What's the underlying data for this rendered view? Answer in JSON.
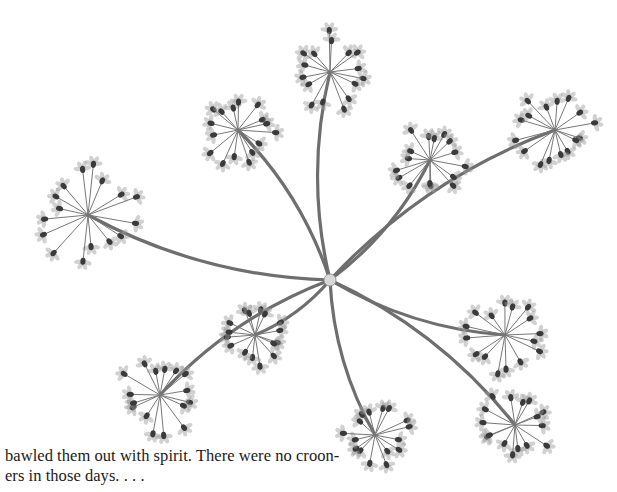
{
  "page": {
    "illustration": {
      "subject": "umbel-flower-plant",
      "stem_color": "#6e6e6e",
      "floret_color": "#9a9a9a",
      "bud_color": "#3a3a3a",
      "hub": {
        "x": 330,
        "y": 280
      },
      "umbels": [
        {
          "name": "umbel-top-center",
          "x": 330,
          "y": 72,
          "r": 42
        },
        {
          "name": "umbel-upper-left",
          "x": 238,
          "y": 130,
          "r": 38
        },
        {
          "name": "umbel-left",
          "x": 88,
          "y": 215,
          "r": 52
        },
        {
          "name": "umbel-upper-mid-right",
          "x": 430,
          "y": 160,
          "r": 38
        },
        {
          "name": "umbel-upper-right",
          "x": 555,
          "y": 130,
          "r": 42
        },
        {
          "name": "umbel-right",
          "x": 505,
          "y": 335,
          "r": 40
        },
        {
          "name": "umbel-lower-right",
          "x": 515,
          "y": 425,
          "r": 38
        },
        {
          "name": "umbel-bottom-center",
          "x": 375,
          "y": 435,
          "r": 36
        },
        {
          "name": "umbel-lower-left-small",
          "x": 255,
          "y": 335,
          "r": 32
        },
        {
          "name": "umbel-lower-left",
          "x": 160,
          "y": 395,
          "r": 42
        }
      ]
    },
    "caption": {
      "line1": "bawled them out with spirit. There were no croon-",
      "line2": "ers in those days. . . ."
    }
  }
}
